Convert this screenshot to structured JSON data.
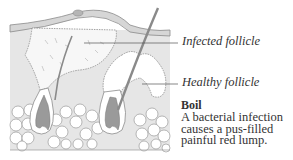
{
  "diagram": {
    "labels": [
      {
        "id": "infected",
        "text": "Infected follicle"
      },
      {
        "id": "healthy",
        "text": "Healthy follicle"
      }
    ],
    "caption": {
      "title": "Boil",
      "text_lines": [
        "A bacterial infection",
        "causes a pus-filled",
        "painful red lump."
      ]
    },
    "colors": {
      "background": "#ffffff",
      "skin_fill": "#e4e4e4",
      "outline": "#8a8a8a",
      "hair": "#9a9a9a",
      "text": "#333333"
    }
  }
}
